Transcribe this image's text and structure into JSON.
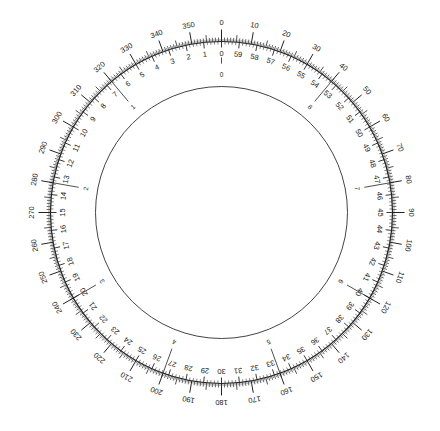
{
  "diagram": {
    "title": "",
    "type": "circular-dial-scale",
    "colors": {
      "background": "#ffffff",
      "ink": "#222222",
      "inner_circle": "#444444"
    },
    "geometry": {
      "center": [
        221.5,
        212.5
      ],
      "ring_radius": 171,
      "inner_circle_radius": 126
    },
    "outer_degree_scale": {
      "description": "Degree scale, clockwise from top, labeled every 10 degrees",
      "direction": "clockwise",
      "minor_tick_step": 1,
      "mid_tick_step": 5,
      "major_tick_step": 10,
      "labels": [
        "0",
        "10",
        "20",
        "30",
        "40",
        "50",
        "60",
        "70",
        "80",
        "90",
        "100",
        "110",
        "120",
        "130",
        "140",
        "150",
        "160",
        "170",
        "180",
        "190",
        "200",
        "210",
        "220",
        "230",
        "240",
        "250",
        "260",
        "270",
        "280",
        "290",
        "300",
        "310",
        "320",
        "330",
        "340",
        "350"
      ]
    },
    "inner_minute_scale": {
      "description": "Minute scale, counter-clockwise from top, 60 divisions",
      "direction": "counter-clockwise",
      "divisions": 60,
      "labels": [
        "0",
        "1",
        "2",
        "3",
        "4",
        "5",
        "6",
        "7",
        "8",
        "9",
        "10",
        "11",
        "12",
        "13",
        "14",
        "15",
        "16",
        "17",
        "18",
        "19",
        "20",
        "21",
        "22",
        "23",
        "24",
        "25",
        "26",
        "27",
        "28",
        "29",
        "30",
        "31",
        "32",
        "33",
        "34",
        "35",
        "36",
        "37",
        "38",
        "39",
        "40",
        "41",
        "42",
        "43",
        "44",
        "45",
        "46",
        "47",
        "48",
        "49",
        "50",
        "51",
        "52",
        "53",
        "54",
        "55",
        "56",
        "57",
        "58",
        "59"
      ]
    },
    "hour_marks": {
      "description": "Hour marks, counter-clockwise, 9 divisions of 40 degrees",
      "direction": "counter-clockwise",
      "step_degrees": 40,
      "labels": [
        "0",
        "1",
        "2",
        "3",
        "4",
        "5",
        "6",
        "7",
        "8"
      ]
    }
  }
}
